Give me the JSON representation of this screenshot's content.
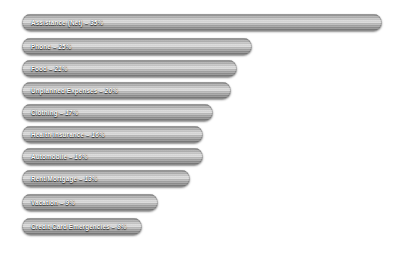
{
  "chart_data": {
    "type": "bar",
    "orientation": "horizontal",
    "title": "",
    "xlabel": "",
    "ylabel": "",
    "grid": false,
    "legend": "none",
    "axis_visible": false,
    "value_suffix": "%",
    "xlim": [
      0,
      38
    ],
    "bar_color": "#a8a8a8",
    "label_color": "#ffffff",
    "background_color": "#ffffff",
    "categories": [
      "Assistance (Net)",
      "Phone",
      "Food",
      "Unplanned Expenses",
      "Clothing",
      "Health Insurance",
      "Automobile",
      "Rent/Mortgage",
      "Vacation",
      "Credit Card Emergencies"
    ],
    "values": [
      35,
      25,
      21,
      20,
      17,
      16,
      16,
      13,
      9,
      8
    ],
    "bars": [
      {
        "label": "Assistance (Net)",
        "value": 35,
        "value_text": "35%",
        "separator": " – ",
        "bar_label": "Assistance (Net)  – 35%"
      },
      {
        "label": "Phone",
        "value": 25,
        "value_text": "25%",
        "separator": " – ",
        "bar_label": "Phone – 25%"
      },
      {
        "label": "Food",
        "value": 21,
        "value_text": "21%",
        "separator": " – ",
        "bar_label": "Food – 21%"
      },
      {
        "label": "Unplanned Expenses",
        "value": 20,
        "value_text": "20%",
        "separator": " – ",
        "bar_label": "Unplanned Expenses – 20%"
      },
      {
        "label": "Clothing",
        "value": 17,
        "value_text": "17%",
        "separator": " – ",
        "bar_label": "Clothing – 17%"
      },
      {
        "label": "Health Insurance",
        "value": 16,
        "value_text": "16%",
        "separator": " – ",
        "bar_label": "Health Insurance – 16%"
      },
      {
        "label": "Automobile",
        "value": 16,
        "value_text": "16%",
        "separator": " – ",
        "bar_label": "Automobile – 16%"
      },
      {
        "label": "Rent/Mortgage",
        "value": 13,
        "value_text": "13%",
        "separator": " – ",
        "bar_label": "Rent/Mortgage – 13%"
      },
      {
        "label": "Vacation",
        "value": 9,
        "value_text": "9%",
        "separator": " – ",
        "bar_label": "Vacation – 9%"
      },
      {
        "label": "Credit Card Emergencies",
        "value": 8,
        "value_text": "8%",
        "separator": " – ",
        "bar_label": "Credit Card Emergencies – 8%"
      }
    ]
  },
  "layout": {
    "bar_pixel_widths": [
      360,
      230,
      215,
      209,
      191,
      181,
      181,
      168,
      136,
      120
    ],
    "bar_top_positions": [
      14,
      38,
      60,
      82,
      104,
      126,
      148,
      170,
      194,
      218
    ]
  }
}
